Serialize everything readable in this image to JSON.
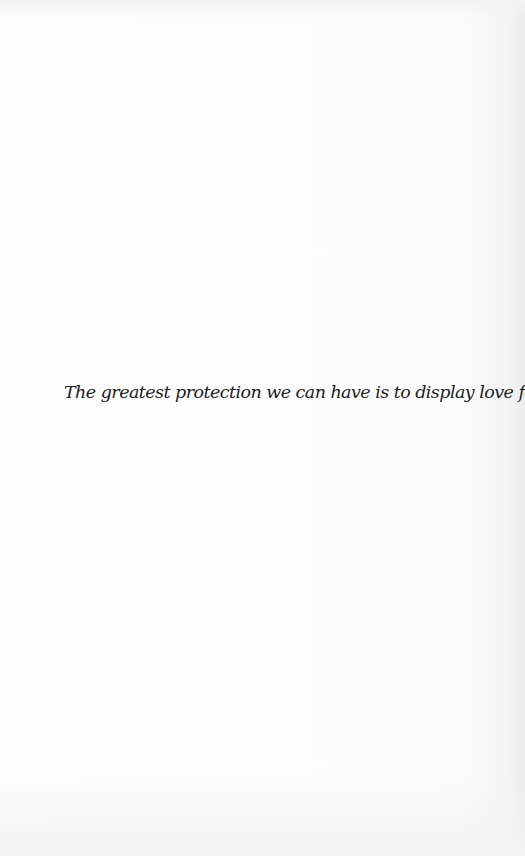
{
  "page": {
    "background": "#fbfbfb",
    "text_color": "#1c1c1c"
  },
  "quote": {
    "text": "The greatest protection we can have is to display love for others."
  }
}
